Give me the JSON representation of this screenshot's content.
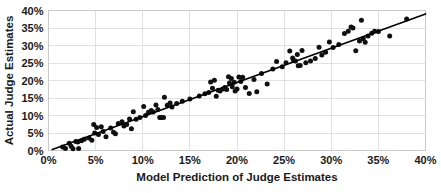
{
  "chart_data": {
    "type": "scatter",
    "title": "",
    "xlabel": "Model Prediction of Judge Estimates",
    "ylabel": "Actual Judge Estimates",
    "xlim": [
      0,
      40
    ],
    "ylim": [
      0,
      40
    ],
    "x_tick_labels": [
      "0%",
      "5%",
      "10%",
      "15%",
      "20%",
      "25%",
      "30%",
      "35%",
      "40%"
    ],
    "y_tick_labels": [
      "0%",
      "5%",
      "10%",
      "15%",
      "20%",
      "25%",
      "30%",
      "35%",
      "40%"
    ],
    "x_ticks": [
      0,
      5,
      10,
      15,
      20,
      25,
      30,
      35,
      40
    ],
    "y_ticks": [
      0,
      5,
      10,
      15,
      20,
      25,
      30,
      35,
      40
    ],
    "grid": true,
    "legend": "none",
    "unit": "percent",
    "marker": {
      "shape": "circle",
      "color": "#101010",
      "size": 2.5
    },
    "trendline": {
      "show": true,
      "color": "#000000",
      "x_start": 0.4,
      "y_start": 0.3,
      "x_end": 40.0,
      "y_end": 39.0
    },
    "points": [
      [
        1.5,
        1.0
      ],
      [
        1.8,
        0.6
      ],
      [
        2.2,
        2.1
      ],
      [
        2.4,
        1.2
      ],
      [
        2.6,
        0.5
      ],
      [
        2.9,
        2.6
      ],
      [
        3.1,
        2.4
      ],
      [
        3.2,
        0.6
      ],
      [
        3.5,
        2.8
      ],
      [
        3.8,
        3.2
      ],
      [
        4.3,
        3.6
      ],
      [
        4.6,
        2.9
      ],
      [
        4.8,
        7.4
      ],
      [
        4.9,
        5.0
      ],
      [
        5.1,
        6.6
      ],
      [
        5.3,
        4.6
      ],
      [
        5.6,
        6.8
      ],
      [
        5.8,
        5.4
      ],
      [
        6.1,
        3.9
      ],
      [
        6.6,
        6.4
      ],
      [
        6.9,
        5.2
      ],
      [
        7.1,
        4.8
      ],
      [
        7.4,
        7.7
      ],
      [
        7.8,
        8.2
      ],
      [
        8.0,
        7.0
      ],
      [
        8.3,
        7.4
      ],
      [
        8.6,
        9.0
      ],
      [
        8.8,
        6.2
      ],
      [
        9.0,
        11.1
      ],
      [
        9.3,
        8.9
      ],
      [
        9.7,
        9.4
      ],
      [
        10.1,
        12.6
      ],
      [
        10.3,
        10.0
      ],
      [
        10.6,
        10.9
      ],
      [
        10.9,
        11.4
      ],
      [
        11.1,
        11.0
      ],
      [
        11.4,
        13.0
      ],
      [
        11.6,
        11.7
      ],
      [
        11.8,
        9.4
      ],
      [
        12.0,
        9.4
      ],
      [
        12.2,
        9.4
      ],
      [
        12.3,
        15.2
      ],
      [
        12.6,
        12.9
      ],
      [
        12.9,
        13.6
      ],
      [
        13.1,
        12.4
      ],
      [
        13.6,
        13.4
      ],
      [
        14.2,
        14.1
      ],
      [
        15.0,
        14.7
      ],
      [
        16.0,
        15.6
      ],
      [
        16.6,
        16.2
      ],
      [
        17.0,
        16.6
      ],
      [
        17.2,
        19.6
      ],
      [
        17.4,
        17.8
      ],
      [
        17.6,
        20.1
      ],
      [
        17.8,
        15.5
      ],
      [
        18.0,
        17.2
      ],
      [
        18.2,
        17.0
      ],
      [
        18.5,
        17.6
      ],
      [
        18.7,
        18.0
      ],
      [
        18.9,
        17.4
      ],
      [
        19.1,
        21.1
      ],
      [
        19.2,
        19.3
      ],
      [
        19.4,
        20.6
      ],
      [
        19.5,
        18.2
      ],
      [
        19.7,
        19.5
      ],
      [
        19.8,
        17.0
      ],
      [
        20.0,
        17.6
      ],
      [
        20.2,
        21.0
      ],
      [
        20.4,
        19.7
      ],
      [
        20.6,
        20.9
      ],
      [
        20.9,
        18.0
      ],
      [
        21.3,
        16.3
      ],
      [
        21.8,
        20.3
      ],
      [
        22.1,
        16.8
      ],
      [
        22.6,
        22.0
      ],
      [
        23.2,
        19.0
      ],
      [
        23.8,
        23.3
      ],
      [
        24.2,
        25.4
      ],
      [
        24.8,
        23.9
      ],
      [
        25.2,
        25.1
      ],
      [
        25.6,
        28.4
      ],
      [
        25.9,
        26.4
      ],
      [
        26.0,
        25.8
      ],
      [
        26.2,
        25.6
      ],
      [
        26.4,
        27.4
      ],
      [
        26.5,
        24.2
      ],
      [
        26.7,
        24.3
      ],
      [
        26.9,
        28.6
      ],
      [
        27.3,
        25.1
      ],
      [
        27.8,
        25.6
      ],
      [
        28.3,
        26.3
      ],
      [
        28.7,
        29.5
      ],
      [
        29.0,
        27.3
      ],
      [
        29.4,
        28.1
      ],
      [
        29.8,
        31.0
      ],
      [
        30.2,
        29.4
      ],
      [
        30.8,
        30.3
      ],
      [
        31.4,
        33.4
      ],
      [
        31.8,
        34.1
      ],
      [
        32.1,
        35.3
      ],
      [
        32.3,
        35.0
      ],
      [
        32.6,
        28.5
      ],
      [
        33.0,
        31.3
      ],
      [
        33.2,
        37.2
      ],
      [
        33.4,
        31.9
      ],
      [
        33.6,
        30.9
      ],
      [
        33.9,
        32.7
      ],
      [
        34.3,
        33.5
      ],
      [
        34.6,
        34.1
      ],
      [
        35.0,
        34.0
      ],
      [
        36.2,
        32.7
      ],
      [
        38.0,
        37.6
      ]
    ]
  }
}
